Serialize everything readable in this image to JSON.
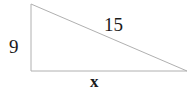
{
  "figure": {
    "kind": "right-triangle-diagram",
    "background_color": "#ffffff",
    "stroke_color": "#b0b0b0",
    "stroke_width": 1,
    "text_color": "#1a1a1a",
    "width": 193,
    "height": 92,
    "vertices": {
      "apex": {
        "x": 31,
        "y": 4
      },
      "right_angle": {
        "x": 31,
        "y": 71
      },
      "base_right": {
        "x": 187,
        "y": 71
      }
    },
    "labels": {
      "vertical_leg": "9",
      "hypotenuse": "15",
      "horizontal_leg": "x"
    }
  },
  "chart_data": {
    "type": "diagram",
    "title": "",
    "shape": "right triangle",
    "sides": [
      {
        "name": "vertical leg",
        "label": "9",
        "known": true,
        "value": 9,
        "from": "apex",
        "to": "right_angle"
      },
      {
        "name": "hypotenuse",
        "label": "15",
        "known": true,
        "value": 15,
        "from": "apex",
        "to": "base_right"
      },
      {
        "name": "horizontal leg",
        "label": "x",
        "known": false,
        "value": null,
        "from": "right_angle",
        "to": "base_right"
      }
    ],
    "right_angle_at": "right_angle"
  }
}
